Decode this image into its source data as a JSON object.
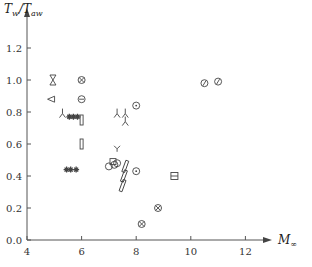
{
  "chart_data": {
    "type": "scatter",
    "title": "",
    "xlabel": "M∞",
    "ylabel": "Tw/Taw",
    "xlim": [
      4,
      13
    ],
    "ylim": [
      0,
      1.35
    ],
    "grid": false,
    "x_ticks": [
      "4",
      "6",
      "8",
      "10",
      "12"
    ],
    "y_ticks": [
      "0.0",
      "0.2",
      "0.4",
      "0.6",
      "0.8",
      "1.0",
      "1.2"
    ],
    "series": [
      {
        "name": "bowtie",
        "marker": "bowtie",
        "points": [
          [
            4.95,
            1.0
          ]
        ]
      },
      {
        "name": "circle-cross-a",
        "marker": "circle-x",
        "points": [
          [
            6.0,
            1.0
          ]
        ]
      },
      {
        "name": "triangle-left",
        "marker": "tri-left",
        "points": [
          [
            4.9,
            0.88
          ]
        ]
      },
      {
        "name": "circle-minus",
        "marker": "circle-minus",
        "points": [
          [
            6.0,
            0.88
          ]
        ]
      },
      {
        "name": "tripod",
        "marker": "tripod",
        "points": [
          [
            5.3,
            0.79
          ],
          [
            7.3,
            0.79
          ],
          [
            7.6,
            0.79
          ],
          [
            7.6,
            0.74
          ]
        ]
      },
      {
        "name": "stars",
        "marker": "star",
        "points": [
          [
            5.55,
            0.77
          ],
          [
            5.7,
            0.77
          ],
          [
            5.85,
            0.77
          ],
          [
            5.45,
            0.44
          ],
          [
            5.6,
            0.44
          ],
          [
            5.8,
            0.44
          ]
        ]
      },
      {
        "name": "vertical-rect",
        "marker": "vrect",
        "points": [
          [
            6.0,
            0.75
          ],
          [
            6.0,
            0.6
          ]
        ]
      },
      {
        "name": "circle-dot",
        "marker": "circle-dot",
        "points": [
          [
            8.0,
            0.84
          ],
          [
            8.0,
            0.43
          ]
        ]
      },
      {
        "name": "Y-marker",
        "marker": "y",
        "points": [
          [
            7.3,
            0.57
          ]
        ]
      },
      {
        "name": "open-circle",
        "marker": "circle",
        "points": [
          [
            7.0,
            0.46
          ],
          [
            7.2,
            0.47
          ],
          [
            7.3,
            0.48
          ]
        ]
      },
      {
        "name": "square",
        "marker": "square",
        "points": [
          [
            7.15,
            0.49
          ]
        ]
      },
      {
        "name": "slanted-rect",
        "marker": "slant",
        "points": [
          [
            7.6,
            0.46
          ],
          [
            7.55,
            0.4
          ],
          [
            7.5,
            0.34
          ]
        ]
      },
      {
        "name": "boxed-plus",
        "marker": "box-plus",
        "points": [
          [
            9.4,
            0.4
          ]
        ]
      },
      {
        "name": "circle-cross-b",
        "marker": "circle-x",
        "points": [
          [
            8.8,
            0.2
          ],
          [
            8.2,
            0.1
          ]
        ]
      },
      {
        "name": "circle-slash",
        "marker": "circle-slash",
        "points": [
          [
            10.5,
            0.98
          ],
          [
            11.0,
            0.99
          ]
        ]
      }
    ]
  }
}
